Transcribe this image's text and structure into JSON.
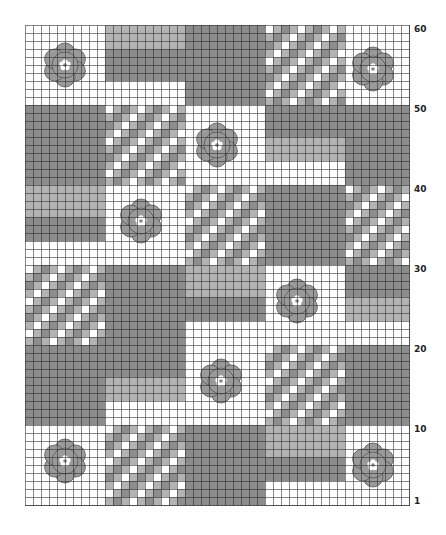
{
  "chart": {
    "columns": 48,
    "rows": 60,
    "cell_px": 8,
    "colors": {
      "white": "#ffffff",
      "light": "#b3b3b3",
      "dark": "#8c8c8c",
      "mid": "#9e9e9e",
      "flower": "#9a9a9a",
      "grid": "#333333"
    },
    "row_labels": [
      {
        "label": "60",
        "row": 60
      },
      {
        "label": "50",
        "row": 50
      },
      {
        "label": "40",
        "row": 40
      },
      {
        "label": "30",
        "row": 30
      },
      {
        "label": "20",
        "row": 20
      },
      {
        "label": "10",
        "row": 10
      },
      {
        "label": "1",
        "row": 1
      }
    ],
    "blocks": [
      {
        "type": "white",
        "c": 0,
        "r": 0,
        "w": 10,
        "h": 10
      },
      {
        "type": "light",
        "c": 10,
        "r": 0,
        "w": 10,
        "h": 3
      },
      {
        "type": "dark",
        "c": 10,
        "r": 3,
        "w": 10,
        "h": 4
      },
      {
        "type": "white",
        "c": 10,
        "r": 7,
        "w": 10,
        "h": 3
      },
      {
        "type": "dark",
        "c": 20,
        "r": 0,
        "w": 10,
        "h": 10
      },
      {
        "type": "check",
        "c": 30,
        "r": 0,
        "w": 10,
        "h": 10
      },
      {
        "type": "white",
        "c": 40,
        "r": 0,
        "w": 8,
        "h": 10
      },
      {
        "type": "dark",
        "c": 0,
        "r": 10,
        "w": 10,
        "h": 10
      },
      {
        "type": "check",
        "c": 10,
        "r": 10,
        "w": 10,
        "h": 10
      },
      {
        "type": "white",
        "c": 20,
        "r": 10,
        "w": 10,
        "h": 10
      },
      {
        "type": "dark",
        "c": 30,
        "r": 10,
        "w": 10,
        "h": 4
      },
      {
        "type": "light",
        "c": 30,
        "r": 14,
        "w": 10,
        "h": 3
      },
      {
        "type": "white",
        "c": 30,
        "r": 17,
        "w": 10,
        "h": 3
      },
      {
        "type": "dark",
        "c": 40,
        "r": 10,
        "w": 8,
        "h": 10
      },
      {
        "type": "light",
        "c": 0,
        "r": 20,
        "w": 10,
        "h": 4
      },
      {
        "type": "dark",
        "c": 0,
        "r": 24,
        "w": 10,
        "h": 3
      },
      {
        "type": "white",
        "c": 0,
        "r": 27,
        "w": 10,
        "h": 3
      },
      {
        "type": "white",
        "c": 10,
        "r": 20,
        "w": 10,
        "h": 10
      },
      {
        "type": "check",
        "c": 20,
        "r": 20,
        "w": 10,
        "h": 10
      },
      {
        "type": "dark",
        "c": 30,
        "r": 20,
        "w": 10,
        "h": 10
      },
      {
        "type": "check",
        "c": 40,
        "r": 20,
        "w": 8,
        "h": 10
      },
      {
        "type": "check",
        "c": 0,
        "r": 30,
        "w": 10,
        "h": 10
      },
      {
        "type": "dark",
        "c": 10,
        "r": 30,
        "w": 10,
        "h": 10
      },
      {
        "type": "light",
        "c": 20,
        "r": 30,
        "w": 10,
        "h": 4
      },
      {
        "type": "dark",
        "c": 20,
        "r": 34,
        "w": 10,
        "h": 3
      },
      {
        "type": "white",
        "c": 20,
        "r": 37,
        "w": 10,
        "h": 3
      },
      {
        "type": "white",
        "c": 30,
        "r": 30,
        "w": 10,
        "h": 10
      },
      {
        "type": "dark",
        "c": 40,
        "r": 30,
        "w": 8,
        "h": 4
      },
      {
        "type": "light",
        "c": 40,
        "r": 34,
        "w": 8,
        "h": 3
      },
      {
        "type": "white",
        "c": 40,
        "r": 37,
        "w": 8,
        "h": 3
      },
      {
        "type": "dark",
        "c": 0,
        "r": 40,
        "w": 10,
        "h": 10
      },
      {
        "type": "dark",
        "c": 10,
        "r": 40,
        "w": 10,
        "h": 4
      },
      {
        "type": "light",
        "c": 10,
        "r": 44,
        "w": 10,
        "h": 3
      },
      {
        "type": "white",
        "c": 10,
        "r": 47,
        "w": 10,
        "h": 3
      },
      {
        "type": "white",
        "c": 20,
        "r": 40,
        "w": 10,
        "h": 10
      },
      {
        "type": "check",
        "c": 30,
        "r": 40,
        "w": 10,
        "h": 10
      },
      {
        "type": "dark",
        "c": 40,
        "r": 40,
        "w": 8,
        "h": 10
      },
      {
        "type": "white",
        "c": 0,
        "r": 50,
        "w": 10,
        "h": 10
      },
      {
        "type": "check",
        "c": 10,
        "r": 50,
        "w": 10,
        "h": 10
      },
      {
        "type": "dark",
        "c": 20,
        "r": 50,
        "w": 10,
        "h": 10
      },
      {
        "type": "light",
        "c": 30,
        "r": 50,
        "w": 10,
        "h": 4
      },
      {
        "type": "dark",
        "c": 30,
        "r": 54,
        "w": 10,
        "h": 3
      },
      {
        "type": "white",
        "c": 30,
        "r": 57,
        "w": 10,
        "h": 3
      },
      {
        "type": "white",
        "c": 40,
        "r": 50,
        "w": 8,
        "h": 10
      }
    ],
    "flowers": [
      {
        "c": 5,
        "r": 5
      },
      {
        "c": 43.5,
        "r": 5.5
      },
      {
        "c": 24,
        "r": 15
      },
      {
        "c": 14.5,
        "r": 24.5
      },
      {
        "c": 34,
        "r": 34.5
      },
      {
        "c": 24.5,
        "r": 44.5
      },
      {
        "c": 5,
        "r": 54.5
      },
      {
        "c": 43.5,
        "r": 55
      }
    ]
  }
}
